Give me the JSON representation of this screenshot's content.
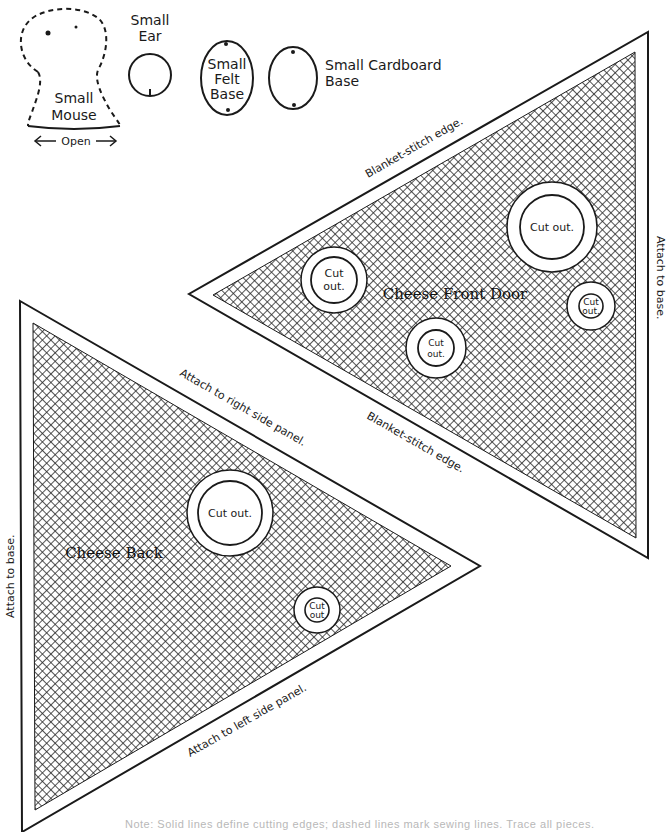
{
  "document": {
    "type": "sewing pattern page",
    "colors": {
      "ink": "#1a1a1a",
      "paper": "#ffffff",
      "hatch": "#2a2a2a"
    }
  },
  "small_pieces": {
    "mouse": {
      "label_line1": "Small",
      "label_line2": "Mouse",
      "open_label": "Open"
    },
    "ear": {
      "label_line1": "Small",
      "label_line2": "Ear"
    },
    "felt_base": {
      "label_line1": "Small",
      "label_line2": "Felt",
      "label_line3": "Base"
    },
    "cardboard_base": {
      "label_line1": "Small  Cardboard",
      "label_line2": "Base"
    }
  },
  "cheese_front_door": {
    "title": "Cheese Front Door",
    "edge_labels": {
      "top": "Blanket-stitch edge.",
      "bottom": "Blanket-stitch edge.",
      "right": "Attach to base."
    },
    "cutouts": [
      {
        "label_line1": "Cut out.",
        "label_line2": ""
      },
      {
        "label_line1": "Cut",
        "label_line2": "out."
      },
      {
        "label_line1": "Cut",
        "label_line2": "out."
      },
      {
        "label_line1": "Cut",
        "label_line2": "out."
      }
    ]
  },
  "cheese_back": {
    "title": "Cheese Back",
    "edge_labels": {
      "top": "Attach to right side panel.",
      "bottom": "Attach to left side panel.",
      "left": "Attach to base."
    },
    "cutouts": [
      {
        "label_line1": "Cut out.",
        "label_line2": ""
      },
      {
        "label_line1": "Cut",
        "label_line2": "out"
      }
    ]
  },
  "footer": {
    "note": "Note: Solid lines define cutting edges; dashed lines mark sewing lines. Trace all pieces."
  }
}
